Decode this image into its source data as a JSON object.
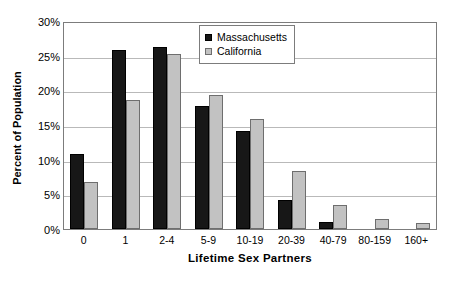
{
  "chart_data": {
    "type": "bar",
    "title": "",
    "xlabel": "Lifetime Sex Partners",
    "ylabel": "Percent of Population",
    "categories": [
      "0",
      "1",
      "2-4",
      "5-9",
      "10-19",
      "20-39",
      "40-79",
      "80-159",
      "160+"
    ],
    "series": [
      {
        "name": "Massachusetts",
        "color": "#171717",
        "values": [
          10.8,
          25.8,
          26.3,
          17.8,
          14.2,
          4.2,
          1.0,
          0.0,
          0.0
        ]
      },
      {
        "name": "California",
        "color": "#c2c2c2",
        "values": [
          6.8,
          18.6,
          25.2,
          19.4,
          15.9,
          8.3,
          3.5,
          1.4,
          0.9
        ]
      }
    ],
    "ylim": [
      0,
      30
    ],
    "ytick_values": [
      0,
      5,
      10,
      15,
      20,
      25,
      30
    ],
    "ytick_labels": [
      "0%",
      "5%",
      "10%",
      "15%",
      "20%",
      "25%",
      "30%"
    ],
    "grid": true,
    "legend_position": "upper-right-inside"
  },
  "legend": {
    "items": [
      {
        "label": "Massachusetts",
        "swatch": "dark-square-swatch"
      },
      {
        "label": "California",
        "swatch": "light-square-swatch"
      }
    ]
  },
  "axes": {
    "y_title": "Percent of Population",
    "x_title": "Lifetime Sex Partners"
  }
}
